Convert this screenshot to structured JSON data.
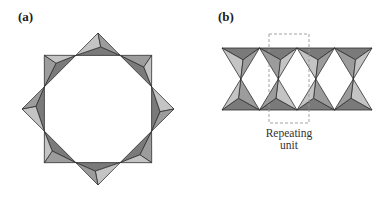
{
  "panels": [
    {
      "id": "a",
      "label": "(a)",
      "description": "Ring of 8 corner-sharing tetrahedra (cyclic silicate)"
    },
    {
      "id": "b",
      "label": "(b)",
      "description": "Double chain of corner-sharing tetrahedra"
    }
  ],
  "annotation": {
    "caption_line1": "Repeating",
    "caption_line2": "unit"
  },
  "colors": {
    "dark_face": "#7a7a7a",
    "mid_face": "#9c9c9c",
    "light_face": "#c4c4c4",
    "edge": "#2e2e2e",
    "dash_box": "#999999"
  },
  "ring": {
    "tetrahedra_count": 8,
    "center": [
      98,
      109
    ]
  },
  "chain": {
    "tetrahedra_per_row": 4,
    "rows": 2
  }
}
